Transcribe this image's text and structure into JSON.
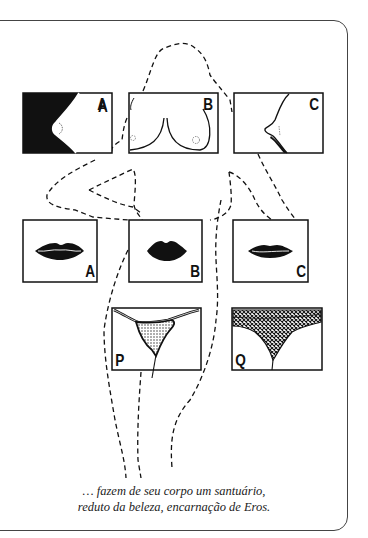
{
  "illustration": {
    "breast_panels": [
      {
        "label": "A"
      },
      {
        "label": "B"
      },
      {
        "label": "C"
      }
    ],
    "lips_panels": [
      {
        "label": "A"
      },
      {
        "label": "B"
      },
      {
        "label": "C"
      }
    ],
    "pelvis_panels": [
      {
        "label": "P"
      },
      {
        "label": "Q"
      }
    ]
  },
  "caption": {
    "line1": "… fazem de seu corpo um santuário,",
    "line2": "reduto da beleza, encarnação de Eros."
  }
}
